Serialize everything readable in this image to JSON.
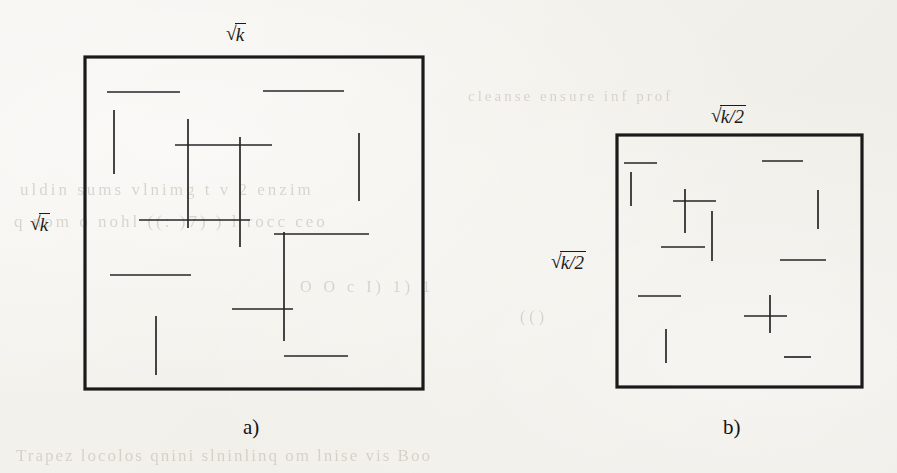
{
  "figure": {
    "type": "geometric-diagram",
    "panels": [
      {
        "id": "a",
        "caption": "a)",
        "top_label": {
          "radical_sign": "√",
          "radicand": "k"
        },
        "left_label": {
          "radical_sign": "√",
          "radicand": "k"
        },
        "box": {
          "x": 85,
          "y": 57,
          "width": 338,
          "height": 332
        },
        "segments": [
          {
            "orientation": "horizontal",
            "x1": 107,
            "y1": 92,
            "x2": 180,
            "y2": 92
          },
          {
            "orientation": "horizontal",
            "x1": 263,
            "y1": 91,
            "x2": 344,
            "y2": 91
          },
          {
            "orientation": "vertical",
            "x1": 114,
            "y1": 110,
            "x2": 114,
            "y2": 174
          },
          {
            "orientation": "vertical",
            "x1": 188,
            "y1": 119,
            "x2": 188,
            "y2": 228
          },
          {
            "orientation": "vertical",
            "x1": 240,
            "y1": 137,
            "x2": 240,
            "y2": 247
          },
          {
            "orientation": "horizontal",
            "x1": 175,
            "y1": 145,
            "x2": 272,
            "y2": 145
          },
          {
            "orientation": "vertical",
            "x1": 359,
            "y1": 133,
            "x2": 359,
            "y2": 201
          },
          {
            "orientation": "horizontal",
            "x1": 139,
            "y1": 220,
            "x2": 250,
            "y2": 220
          },
          {
            "orientation": "vertical",
            "x1": 284,
            "y1": 232,
            "x2": 284,
            "y2": 341
          },
          {
            "orientation": "horizontal",
            "x1": 274,
            "y1": 234,
            "x2": 369,
            "y2": 234
          },
          {
            "orientation": "horizontal",
            "x1": 110,
            "y1": 275,
            "x2": 191,
            "y2": 275
          },
          {
            "orientation": "vertical",
            "x1": 156,
            "y1": 316,
            "x2": 156,
            "y2": 375
          },
          {
            "orientation": "horizontal",
            "x1": 232,
            "y1": 309,
            "x2": 293,
            "y2": 309
          },
          {
            "orientation": "horizontal",
            "x1": 284,
            "y1": 356,
            "x2": 348,
            "y2": 356
          }
        ]
      },
      {
        "id": "b",
        "caption": "b)",
        "top_label": {
          "radical_sign": "√",
          "radicand": "k",
          "divisor": "/2"
        },
        "left_label": {
          "radical_sign": "√",
          "radicand": "k",
          "divisor": "/2"
        },
        "box": {
          "x": 617,
          "y": 135,
          "width": 245,
          "height": 252
        },
        "segments": [
          {
            "orientation": "horizontal",
            "x1": 624,
            "y1": 163,
            "x2": 657,
            "y2": 163
          },
          {
            "orientation": "horizontal",
            "x1": 762,
            "y1": 161,
            "x2": 803,
            "y2": 161
          },
          {
            "orientation": "vertical",
            "x1": 631,
            "y1": 172,
            "x2": 631,
            "y2": 206
          },
          {
            "orientation": "vertical",
            "x1": 685,
            "y1": 189,
            "x2": 685,
            "y2": 233
          },
          {
            "orientation": "horizontal",
            "x1": 673,
            "y1": 201,
            "x2": 716,
            "y2": 201
          },
          {
            "orientation": "vertical",
            "x1": 818,
            "y1": 190,
            "x2": 818,
            "y2": 229
          },
          {
            "orientation": "vertical",
            "x1": 712,
            "y1": 211,
            "x2": 712,
            "y2": 261
          },
          {
            "orientation": "horizontal",
            "x1": 661,
            "y1": 247,
            "x2": 705,
            "y2": 247
          },
          {
            "orientation": "horizontal",
            "x1": 780,
            "y1": 260,
            "x2": 826,
            "y2": 260
          },
          {
            "orientation": "horizontal",
            "x1": 638,
            "y1": 296,
            "x2": 681,
            "y2": 296
          },
          {
            "orientation": "vertical",
            "x1": 770,
            "y1": 295,
            "x2": 770,
            "y2": 333
          },
          {
            "orientation": "horizontal",
            "x1": 744,
            "y1": 316,
            "x2": 787,
            "y2": 316
          },
          {
            "orientation": "vertical",
            "x1": 666,
            "y1": 329,
            "x2": 666,
            "y2": 363
          },
          {
            "orientation": "horizontal",
            "x1": 784,
            "y1": 357,
            "x2": 811,
            "y2": 357
          }
        ]
      }
    ]
  },
  "background_text": {
    "note": "faint show-through text from the reverse page",
    "lines": [
      {
        "text": "cleanse ensure inf  prof",
        "x": 468,
        "y": 88,
        "size": 15,
        "spacing": 3
      },
      {
        "text": "uldin  sums  vlnimg  t v 2  enzim",
        "x": 20,
        "y": 180,
        "size": 17,
        "spacing": 3
      },
      {
        "text": "q   nom   o  nohl  ((:  )7) )   l    rocc ceo",
        "x": 14,
        "y": 212,
        "size": 17,
        "spacing": 3
      },
      {
        "text": "O   O   c   I)  1)   1",
        "x": 300,
        "y": 278,
        "size": 16,
        "spacing": 4
      },
      {
        "text": "(()",
        "x": 520,
        "y": 308,
        "size": 16,
        "spacing": 4
      },
      {
        "text": "Trapez  locolos  qnini  slninlinq  om  lnise vis  Boo",
        "x": 16,
        "y": 446,
        "size": 17,
        "spacing": 2
      }
    ]
  }
}
